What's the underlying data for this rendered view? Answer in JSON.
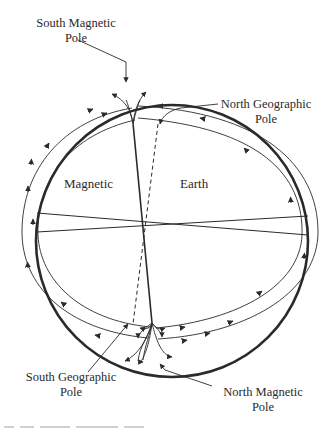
{
  "diagram": {
    "title": "",
    "labels": {
      "south_magnetic_pole": [
        "South Magnetic",
        "Pole"
      ],
      "north_geographic_pole": [
        "North Geographic",
        "Pole"
      ],
      "south_geographic_pole": [
        "South Geographic",
        "Pole"
      ],
      "north_magnetic_pole": [
        "North Magnetic",
        "Pole"
      ],
      "hemisphere_left": "Magnetic",
      "hemisphere_right": "Earth"
    },
    "elements": {
      "earth_circle": {
        "cx": 172,
        "cy": 241,
        "r": 136
      },
      "field_loops": "two concentric arcs per side with arrows flowing from north magnetic pole (bottom) to south magnetic pole (top)",
      "magnetic_axis": "solid line, tilted",
      "geographic_axis": "dashed line"
    },
    "colors": {
      "ink": "#2a2a2a",
      "background": "#ffffff"
    }
  }
}
